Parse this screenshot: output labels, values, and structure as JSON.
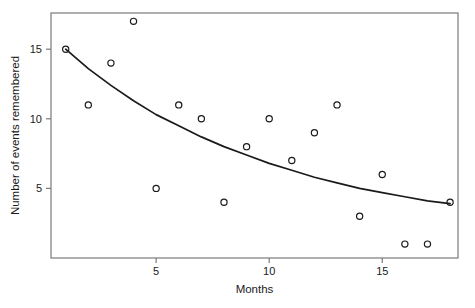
{
  "chart_data": {
    "type": "scatter",
    "title": "",
    "subtitle": "",
    "xlabel": "Months",
    "ylabel": "Number of events remembered",
    "xlim": [
      0.35,
      18.35
    ],
    "ylim": [
      0.0,
      17.6
    ],
    "xticks": [
      5,
      10,
      15
    ],
    "xtick_labels": [
      "5",
      "10",
      "15"
    ],
    "yticks": [
      5,
      10,
      15
    ],
    "ytick_labels": [
      "5",
      "10",
      "15"
    ],
    "grid": false,
    "legend": "none",
    "marker": "open-circle",
    "marker_color": "#1a1a1a",
    "marker_fill": "none",
    "line_color": "#1a1a1a",
    "frame_color": "#7a7a7a",
    "x": [
      1,
      2,
      3,
      4,
      5,
      6,
      7,
      8,
      9,
      10,
      11,
      12,
      13,
      14,
      15,
      16,
      17,
      18
    ],
    "y": [
      15,
      11,
      14,
      17,
      5,
      11,
      10,
      4,
      8,
      10,
      7,
      9,
      11,
      3,
      6,
      1,
      1,
      4
    ],
    "points": [
      {
        "x": 1,
        "y": 15
      },
      {
        "x": 2,
        "y": 11
      },
      {
        "x": 3,
        "y": 14
      },
      {
        "x": 4,
        "y": 17
      },
      {
        "x": 5,
        "y": 5
      },
      {
        "x": 6,
        "y": 11
      },
      {
        "x": 7,
        "y": 10
      },
      {
        "x": 8,
        "y": 4
      },
      {
        "x": 9,
        "y": 8
      },
      {
        "x": 10,
        "y": 10
      },
      {
        "x": 11,
        "y": 7
      },
      {
        "x": 12,
        "y": 9
      },
      {
        "x": 13,
        "y": 11
      },
      {
        "x": 14,
        "y": 3
      },
      {
        "x": 15,
        "y": 6
      },
      {
        "x": 16,
        "y": 1
      },
      {
        "x": 17,
        "y": 1
      },
      {
        "x": 18,
        "y": 4
      }
    ],
    "fit_curve": {
      "name": "exponential-decay-fit",
      "x": [
        1,
        2,
        3,
        4,
        5,
        6,
        7,
        8,
        9,
        10,
        11,
        12,
        13,
        14,
        15,
        16,
        17,
        18
      ],
      "y": [
        15.0,
        13.6,
        12.4,
        11.3,
        10.3,
        9.5,
        8.7,
        8.0,
        7.4,
        6.8,
        6.3,
        5.8,
        5.4,
        5.0,
        4.7,
        4.4,
        4.1,
        3.9
      ]
    }
  },
  "axes": {
    "x_title": "Months",
    "y_title": "Number of events remembered"
  }
}
